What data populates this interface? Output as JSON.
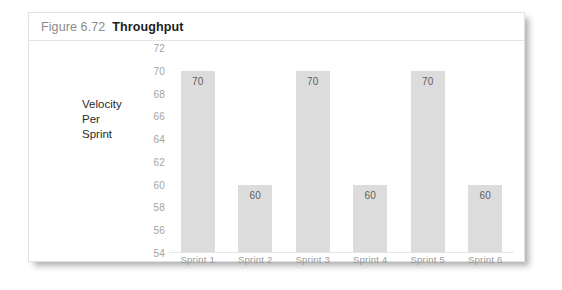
{
  "figure": {
    "number": "Figure 6.72",
    "title": "Throughput"
  },
  "chart_data": {
    "type": "bar",
    "title": "Throughput",
    "categories": [
      "Sprint 1",
      "Sprint 2",
      "Sprint 3",
      "Sprint 4",
      "Sprint 5",
      "Sprint 6"
    ],
    "values": [
      70,
      60,
      70,
      60,
      70,
      60
    ],
    "data_labels": [
      "70",
      "60",
      "70",
      "60",
      "70",
      "60"
    ],
    "xlabel": "",
    "ylabel": "Velocity Per Sprint",
    "ylabel_lines": [
      "Velocity",
      "Per",
      "Sprint"
    ],
    "ylim": [
      54,
      72
    ],
    "ytick_step": 2,
    "yticks": [
      72,
      70,
      68,
      66,
      64,
      62,
      60,
      58,
      56,
      54
    ],
    "ytick_labels": [
      "72",
      "70",
      "68",
      "66",
      "64",
      "62",
      "60",
      "58",
      "56",
      "54"
    ],
    "grid": false,
    "legend": false,
    "bar_color": "#dcdcdc",
    "axis_color": "#e6e6e6",
    "tick_text_color": "#a3a3a3"
  }
}
